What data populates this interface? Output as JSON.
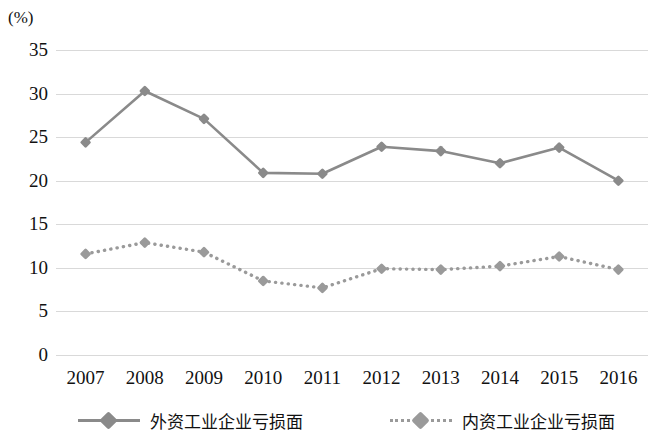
{
  "axis": {
    "unit_label": "(%)",
    "y_ticks": [
      "35",
      "30",
      "25",
      "20",
      "15",
      "10",
      "5",
      "0"
    ],
    "x_ticks": [
      "2007",
      "2008",
      "2009",
      "2010",
      "2011",
      "2012",
      "2013",
      "2014",
      "2015",
      "2016"
    ]
  },
  "legend": {
    "items": [
      {
        "label": "外资工业企业亏损面",
        "style": "solid",
        "color": "#8a8a8a"
      },
      {
        "label": "内资工业企业亏损面",
        "style": "dotted",
        "color": "#9a9a9a"
      }
    ]
  },
  "chart_data": {
    "type": "line",
    "title": "",
    "xlabel": "",
    "ylabel": "(%)",
    "ylim": [
      0,
      35
    ],
    "yticks": [
      0,
      5,
      10,
      15,
      20,
      25,
      30,
      35
    ],
    "grid": true,
    "legend_position": "bottom",
    "categories": [
      "2007",
      "2008",
      "2009",
      "2010",
      "2011",
      "2012",
      "2013",
      "2014",
      "2015",
      "2016"
    ],
    "series": [
      {
        "name": "外资工业企业亏损面",
        "style": "solid",
        "marker": "diamond",
        "color": "#8a8a8a",
        "values": [
          24.4,
          30.3,
          27.1,
          20.9,
          20.8,
          23.9,
          23.4,
          22.0,
          23.8,
          20.0
        ]
      },
      {
        "name": "内资工业企业亏损面",
        "style": "dotted",
        "marker": "diamond",
        "color": "#9a9a9a",
        "values": [
          11.6,
          12.9,
          11.8,
          8.5,
          7.7,
          9.9,
          9.8,
          10.2,
          11.3,
          9.8
        ]
      }
    ]
  }
}
